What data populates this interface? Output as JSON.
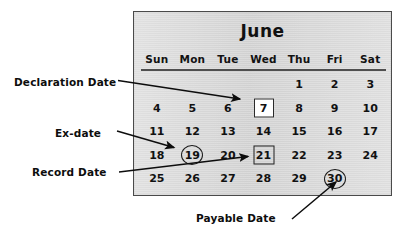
{
  "figure": {
    "title_text": "June",
    "panel_bg_color": "#d9d9d9",
    "panel_border_color": "#4a4a4a",
    "text_color": "#111111",
    "page_bg_color": "#ffffff"
  },
  "calendar": {
    "month": "June",
    "weekday_headers": [
      "Sun",
      "Mon",
      "Tue",
      "Wed",
      "Thu",
      "Fri",
      "Sat"
    ],
    "weeks": [
      [
        {
          "day": "",
          "marker": "none"
        },
        {
          "day": "",
          "marker": "none"
        },
        {
          "day": "",
          "marker": "none"
        },
        {
          "day": "",
          "marker": "none"
        },
        {
          "day": "1",
          "marker": "none"
        },
        {
          "day": "2",
          "marker": "none"
        },
        {
          "day": "3",
          "marker": "none"
        }
      ],
      [
        {
          "day": "4",
          "marker": "none"
        },
        {
          "day": "5",
          "marker": "none"
        },
        {
          "day": "6",
          "marker": "none"
        },
        {
          "day": "7",
          "marker": "box-white"
        },
        {
          "day": "8",
          "marker": "none"
        },
        {
          "day": "9",
          "marker": "none"
        },
        {
          "day": "10",
          "marker": "none"
        }
      ],
      [
        {
          "day": "11",
          "marker": "none"
        },
        {
          "day": "12",
          "marker": "none"
        },
        {
          "day": "13",
          "marker": "none"
        },
        {
          "day": "14",
          "marker": "none"
        },
        {
          "day": "15",
          "marker": "none"
        },
        {
          "day": "16",
          "marker": "none"
        },
        {
          "day": "17",
          "marker": "none"
        }
      ],
      [
        {
          "day": "18",
          "marker": "none"
        },
        {
          "day": "19",
          "marker": "circle"
        },
        {
          "day": "20",
          "marker": "none"
        },
        {
          "day": "21",
          "marker": "box"
        },
        {
          "day": "22",
          "marker": "none"
        },
        {
          "day": "23",
          "marker": "none"
        },
        {
          "day": "24",
          "marker": "none"
        }
      ],
      [
        {
          "day": "25",
          "marker": "none"
        },
        {
          "day": "26",
          "marker": "none"
        },
        {
          "day": "27",
          "marker": "none"
        },
        {
          "day": "28",
          "marker": "none"
        },
        {
          "day": "29",
          "marker": "none"
        },
        {
          "day": "30",
          "marker": "circle"
        },
        {
          "day": "",
          "marker": "none"
        }
      ]
    ]
  },
  "annotations": [
    {
      "id": "declaration-date",
      "label": "Declaration Date",
      "target_day": "7",
      "marker_style": "white square box"
    },
    {
      "id": "ex-date",
      "label": "Ex-date",
      "target_day": "19",
      "marker_style": "circle"
    },
    {
      "id": "record-date",
      "label": "Record Date",
      "target_day": "21",
      "marker_style": "square box"
    },
    {
      "id": "payable-date",
      "label": "Payable Date",
      "target_day": "30",
      "marker_style": "circle"
    }
  ]
}
